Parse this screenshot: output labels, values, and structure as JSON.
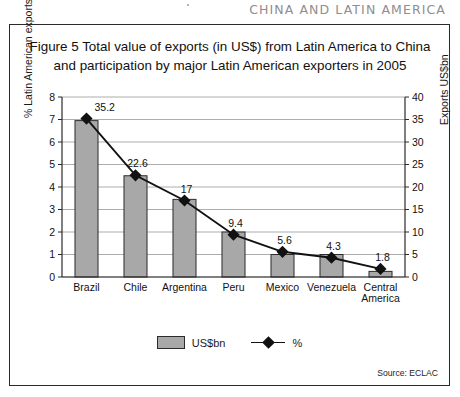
{
  "running_head": "CHINA AND LATIN AMERICA",
  "caption": "Figure 5 Total value of exports (in US$) from Latin America to China and participation by major Latin American exporters in 2005",
  "source": "Source: ECLAC",
  "legend": {
    "bars_label": "US$bn",
    "line_label": "%"
  },
  "axis": {
    "left_title": "% Latin American exports",
    "right_title": "Exports US$bn"
  },
  "colors": {
    "bar_fill": "#a8a8a8",
    "bar_stroke": "#2b2b2b",
    "line": "#111111",
    "frame": "#2b2b2b",
    "running_head": "#8e8e8e"
  },
  "chart_data": {
    "type": "bar",
    "title": "Figure 5 Total value of exports (in US$) from Latin America to China and participation by major Latin American exporters in 2005",
    "categories": [
      "Brazil",
      "Chile",
      "Argentina",
      "Peru",
      "Mexico",
      "Venezuela",
      "Central America"
    ],
    "xlabel": "",
    "ylabel": "% Latin American exports",
    "y2label": "Exports US$bn",
    "ylim": [
      0,
      8
    ],
    "y2lim": [
      0,
      40
    ],
    "yticks": [
      0,
      1,
      2,
      3,
      4,
      5,
      6,
      7,
      8
    ],
    "y2ticks": [
      0,
      5,
      10,
      15,
      20,
      25,
      30,
      35,
      40
    ],
    "grid": true,
    "legend_position": "bottom",
    "series": [
      {
        "name": "US$bn",
        "type": "bar",
        "axis": "left",
        "values": [
          6.95,
          4.5,
          3.45,
          2.0,
          1.0,
          1.0,
          0.25
        ]
      },
      {
        "name": "%",
        "type": "line",
        "axis": "right",
        "values": [
          35.2,
          22.6,
          17,
          9.4,
          5.6,
          4.3,
          1.8
        ],
        "labels": [
          "35.2",
          "22.6",
          "17",
          "9.4",
          "5.6",
          "4.3",
          "1.8"
        ]
      }
    ]
  }
}
